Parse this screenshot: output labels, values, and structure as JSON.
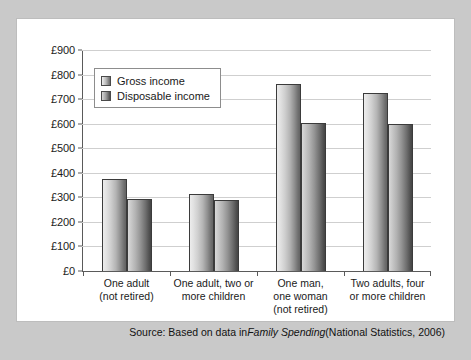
{
  "chart_data": {
    "type": "bar",
    "title": "",
    "xlabel": "",
    "ylabel": "",
    "ylim": [
      0,
      900
    ],
    "grid": true,
    "legend_position": "top-left inside plot",
    "y_ticks": [
      "£0",
      "£100",
      "£200",
      "£300",
      "£400",
      "£500",
      "£600",
      "£700",
      "£800",
      "£900"
    ],
    "y_tick_values": [
      0,
      100,
      200,
      300,
      400,
      500,
      600,
      700,
      800,
      900
    ],
    "categories": [
      "One adult\n(not retired)",
      "One adult, two or\nmore children",
      "One man,\none woman\n(not retired)",
      "Two adults, four\nor more children"
    ],
    "category_lines": [
      [
        "One adult",
        "(not retired)"
      ],
      [
        "One adult, two or",
        "more children"
      ],
      [
        "One man,",
        "one woman",
        "(not retired)"
      ],
      [
        "Two adults, four",
        "or more children"
      ]
    ],
    "series": [
      {
        "name": "Gross income",
        "values": [
          375,
          315,
          760,
          725
        ],
        "color": "#b4b4b4"
      },
      {
        "name": "Disposable income",
        "values": [
          292,
          290,
          602,
          600
        ],
        "color": "#8a8a8a"
      }
    ]
  },
  "legend": {
    "items": [
      {
        "label": "Gross income",
        "swatch": "gross-swatch-icon"
      },
      {
        "label": "Disposable income",
        "swatch": "disposable-swatch-icon"
      }
    ]
  },
  "source": {
    "prefix": "Source: Based on data in ",
    "italic": "Family Spending",
    "suffix": " (National Statistics, 2006)"
  },
  "colors": {
    "frame": "#c9c9c9",
    "panel": "#ffffff",
    "axis": "#5a5a5a",
    "gridline": "#cfcfcf",
    "text": "#1a1a1a"
  }
}
